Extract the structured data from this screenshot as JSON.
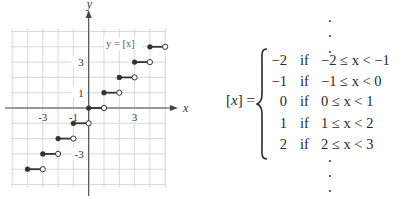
{
  "graph": {
    "label": "y = [x]",
    "x_axis_label": "x",
    "y_axis_label": "y",
    "x_tick_labels": [
      "-3",
      "-1",
      "3"
    ],
    "x_tick_values": [
      -3,
      -1,
      3
    ],
    "y_tick_labels": [
      "3",
      "1",
      "-3"
    ],
    "y_tick_values": [
      3,
      1,
      -3
    ],
    "grid_range": [
      -5,
      5
    ],
    "colors": {
      "grid": "#d8d8d8",
      "axis": "#444444",
      "step": "#333333"
    }
  },
  "chart_data": {
    "type": "line",
    "title": "y = [x]",
    "xlabel": "x",
    "ylabel": "y",
    "xlim": [
      -5,
      5
    ],
    "ylim": [
      -5,
      5
    ],
    "grid": true,
    "x_ticks": [
      -3,
      -1,
      3
    ],
    "y_ticks": [
      -3,
      1,
      3
    ],
    "series": [
      {
        "name": "greatest integer function (step segments: closed left, open right)",
        "segments": [
          {
            "x0": -4,
            "x1": -3,
            "y": -4
          },
          {
            "x0": -3,
            "x1": -2,
            "y": -3
          },
          {
            "x0": -2,
            "x1": -1,
            "y": -2
          },
          {
            "x0": -1,
            "x1": 0,
            "y": -1
          },
          {
            "x0": 0,
            "x1": 1,
            "y": 0
          },
          {
            "x0": 1,
            "x1": 2,
            "y": 1
          },
          {
            "x0": 2,
            "x1": 3,
            "y": 2
          },
          {
            "x0": 3,
            "x1": 4,
            "y": 3
          },
          {
            "x0": 4,
            "x1": 5,
            "y": 4
          }
        ]
      }
    ]
  },
  "formula": {
    "lhs_open": "[",
    "lhs_var": "x",
    "lhs_close": "] =",
    "rows": [
      {
        "value": "−2",
        "if": "if",
        "condition": "−2 ≤ x < −1"
      },
      {
        "value": "−1",
        "if": "if",
        "condition": "−1 ≤ x < 0"
      },
      {
        "value": "0",
        "if": "if",
        "condition": "0 ≤ x < 1"
      },
      {
        "value": "1",
        "if": "if",
        "condition": "1 ≤ x < 2"
      },
      {
        "value": "2",
        "if": "if",
        "condition": "2 ≤ x < 3"
      }
    ]
  }
}
